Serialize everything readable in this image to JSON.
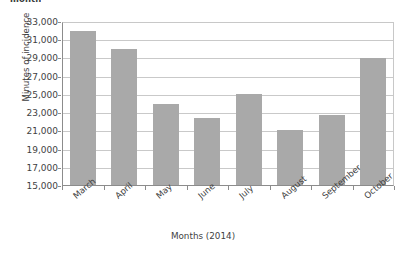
{
  "caption_fragment": "month",
  "chart_data": {
    "type": "bar",
    "title": "",
    "xlabel": "Months (2014)",
    "ylabel": "Minutes of incidence",
    "categories": [
      "March",
      "April",
      "May",
      "June",
      "July",
      "August",
      "September",
      "October"
    ],
    "values": [
      32000,
      30000,
      24000,
      22500,
      25100,
      21100,
      22800,
      29000
    ],
    "ylim": [
      15000,
      33000
    ],
    "yticks": [
      33000,
      31000,
      29000,
      27000,
      25000,
      23000,
      21000,
      19000,
      17000,
      15000
    ],
    "ytick_labels": [
      "33,000",
      "31,000",
      "29,000",
      "27,000",
      "25,000",
      "23,000",
      "21,000",
      "19,000",
      "17,000",
      "15,000"
    ],
    "grid": true,
    "legend": false,
    "series": [
      {
        "name": "Minutes of incidence",
        "color": "#a9a9a9",
        "values": [
          32000,
          30000,
          24000,
          22500,
          25100,
          21100,
          22800,
          29000
        ]
      }
    ]
  },
  "colors": {
    "bar": "#a9a9a9",
    "gridline": "#c9c9c9",
    "axis": "#8c8c8c",
    "text": "#3f3f3f",
    "background": "#ffffff"
  }
}
